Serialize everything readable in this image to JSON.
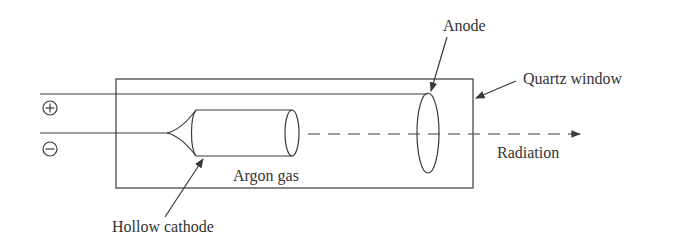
{
  "diagram": {
    "labels": {
      "anode": "Anode",
      "quartz_window": "Quartz window",
      "radiation": "Radiation",
      "argon_gas": "Argon gas",
      "hollow_cathode": "Hollow cathode"
    },
    "terminals": {
      "positive": "+",
      "negative": "−"
    },
    "colors": {
      "line": "#3a3a3a",
      "text": "#333333",
      "background": "#ffffff"
    }
  }
}
